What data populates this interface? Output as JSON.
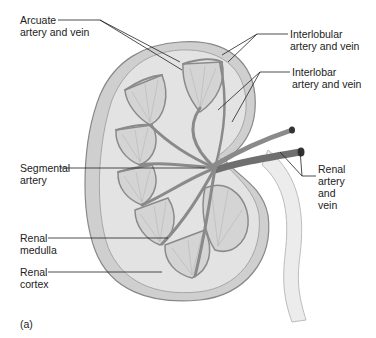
{
  "diagram": {
    "panel_label": "(a)",
    "labels": [
      {
        "id": "arcuate",
        "lines": [
          "Arcuate",
          "artery and vein"
        ]
      },
      {
        "id": "interlobular",
        "lines": [
          "Interlobular",
          "artery and vein"
        ]
      },
      {
        "id": "interlobar",
        "lines": [
          "Interlobar",
          "artery and vein"
        ]
      },
      {
        "id": "segmental",
        "lines": [
          "Segmental",
          "artery"
        ]
      },
      {
        "id": "renal-artery-vein",
        "lines": [
          "Renal",
          "artery",
          "and",
          "vein"
        ]
      },
      {
        "id": "renal-medulla",
        "lines": [
          "Renal",
          "medulla"
        ]
      },
      {
        "id": "renal-cortex",
        "lines": [
          "Renal",
          "cortex"
        ]
      }
    ],
    "colors": {
      "capsule": "#cfcfcf",
      "cortex": "#e2e2e2",
      "pyramid": "#d6d6d6",
      "vessel": "#8a8a8a",
      "vessel_dark": "#555555",
      "ureter": "#e8e8e8",
      "leader": "#222222"
    }
  }
}
